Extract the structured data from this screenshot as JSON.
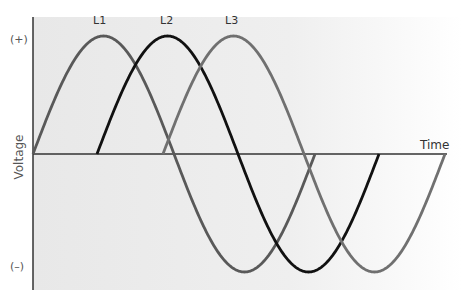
{
  "chart_data": {
    "type": "line",
    "title": "",
    "xlabel": "Time",
    "ylabel": "Voltage",
    "y_tick_labels": [
      "(+)",
      "(–)"
    ],
    "grid": false,
    "legend": "inline labels above peaks",
    "series": [
      {
        "name": "L1",
        "phase_deg": 0,
        "color": "#595959",
        "start_fraction_of_period": 0.0
      },
      {
        "name": "L2",
        "phase_deg": 120,
        "color": "#111111",
        "start_fraction_of_period": 0.0
      },
      {
        "name": "L3",
        "phase_deg": 240,
        "color": "#707070",
        "start_fraction_of_period": 0.0
      }
    ]
  },
  "labels": {
    "l1": "L1",
    "l2": "L2",
    "l3": "L3",
    "plus": "(+)",
    "minus": "(–)",
    "voltage": "Voltage",
    "time": "Time"
  },
  "colors": {
    "bg_left": "#e9e9e9",
    "bg_right": "#ffffff",
    "axis": "#333333"
  }
}
